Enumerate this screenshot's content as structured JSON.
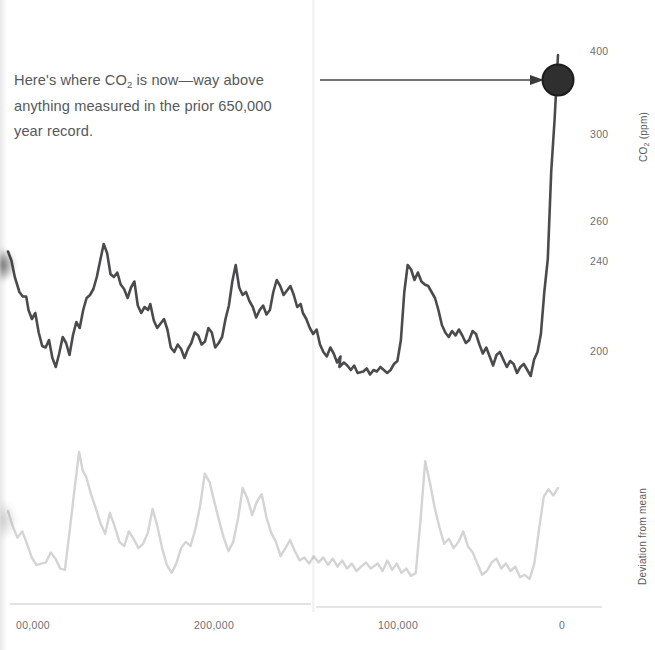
{
  "annotation": {
    "line1": "Here's where CO",
    "sub": "2",
    "line1b": " is now—way above",
    "line2": "anything measured in the prior 650,000",
    "line3": "year record."
  },
  "axes": {
    "y_title_top": "CO",
    "y_title_top_sub": "2",
    "y_title_top_unit": " (ppm)",
    "y_title_bottom": "Deviation from mean",
    "y_ticks": [
      {
        "label": "400",
        "y": 52
      },
      {
        "label": "300",
        "y": 135
      },
      {
        "label": "260",
        "y": 222
      },
      {
        "label": "240",
        "y": 262
      },
      {
        "label": "200",
        "y": 352
      }
    ],
    "x_ticks": [
      {
        "label": "00,000",
        "x": 32
      },
      {
        "label": "200,000",
        "x": 214
      },
      {
        "label": "100,000",
        "x": 398
      },
      {
        "label": "0",
        "x": 562
      }
    ]
  },
  "colors": {
    "co2_line": "#4b4b4d",
    "deviation_line": "#d4d4d4",
    "marker": "#2b2b2b",
    "arrow": "#3a3a3a",
    "axis": "#d8d8d8",
    "text": "#55595c"
  },
  "chart_data": {
    "type": "line",
    "title": "",
    "subtitle": "",
    "xlabel": "",
    "ylabel": "CO2 (ppm)",
    "ylabel_secondary": "Deviation from mean",
    "xlim": [
      650000,
      0
    ],
    "ylim": [
      150,
      415
    ],
    "grid": false,
    "legend": "none",
    "annotation_text": "Here's where CO2 is now—way above anything measured in the prior 650,000 year record.",
    "marker_point": {
      "x": 0,
      "y": 400,
      "label": "present-day CO2"
    },
    "series": [
      {
        "name": "CO2 (ppm)",
        "color": "#4b4b4d",
        "axis": "left",
        "points": [
          [
            0,
            267
          ],
          [
            3,
            261
          ],
          [
            6,
            250
          ],
          [
            10,
            240
          ],
          [
            13,
            237
          ],
          [
            16,
            237
          ],
          [
            18,
            228
          ],
          [
            21,
            222
          ],
          [
            24,
            226
          ],
          [
            27,
            213
          ],
          [
            30,
            204
          ],
          [
            33,
            203
          ],
          [
            36,
            208
          ],
          [
            39,
            196
          ],
          [
            42,
            190
          ],
          [
            45,
            199
          ],
          [
            48,
            210
          ],
          [
            51,
            206
          ],
          [
            54,
            198
          ],
          [
            57,
            211
          ],
          [
            60,
            220
          ],
          [
            63,
            216
          ],
          [
            66,
            228
          ],
          [
            69,
            236
          ],
          [
            72,
            238
          ],
          [
            75,
            242
          ],
          [
            78,
            250
          ],
          [
            81,
            261
          ],
          [
            84,
            272
          ],
          [
            87,
            266
          ],
          [
            90,
            252
          ],
          [
            93,
            250
          ],
          [
            96,
            253
          ],
          [
            99,
            245
          ],
          [
            102,
            242
          ],
          [
            105,
            236
          ],
          [
            108,
            243
          ],
          [
            111,
            247
          ],
          [
            114,
            231
          ],
          [
            117,
            226
          ],
          [
            120,
            230
          ],
          [
            123,
            228
          ],
          [
            125,
            232
          ],
          [
            128,
            221
          ],
          [
            131,
            216
          ],
          [
            134,
            219
          ],
          [
            137,
            222
          ],
          [
            140,
            215
          ],
          [
            143,
            203
          ],
          [
            146,
            200
          ],
          [
            149,
            205
          ],
          [
            152,
            202
          ],
          [
            155,
            196
          ],
          [
            158,
            202
          ],
          [
            161,
            206
          ],
          [
            164,
            213
          ],
          [
            167,
            211
          ],
          [
            170,
            205
          ],
          [
            173,
            207
          ],
          [
            176,
            216
          ],
          [
            179,
            213
          ],
          [
            182,
            203
          ],
          [
            185,
            206
          ],
          [
            188,
            210
          ],
          [
            191,
            222
          ],
          [
            194,
            231
          ],
          [
            197,
            247
          ],
          [
            200,
            258
          ],
          [
            203,
            243
          ],
          [
            206,
            238
          ],
          [
            209,
            240
          ],
          [
            212,
            234
          ],
          [
            215,
            230
          ],
          [
            218,
            223
          ],
          [
            221,
            228
          ],
          [
            224,
            231
          ],
          [
            227,
            225
          ],
          [
            230,
            228
          ],
          [
            233,
            240
          ],
          [
            236,
            248
          ],
          [
            239,
            244
          ],
          [
            242,
            238
          ],
          [
            245,
            241
          ],
          [
            248,
            244
          ],
          [
            251,
            238
          ],
          [
            254,
            230
          ],
          [
            257,
            232
          ],
          [
            259,
            226
          ],
          [
            262,
            222
          ],
          [
            265,
            216
          ],
          [
            268,
            212
          ],
          [
            271,
            215
          ],
          [
            274,
            205
          ],
          [
            277,
            200
          ],
          [
            280,
            197
          ],
          [
            283,
            203
          ],
          [
            286,
            199
          ],
          [
            289,
            193
          ],
          [
            292,
            197
          ],
          [
            291,
            190
          ],
          [
            295,
            193
          ],
          [
            298,
            191
          ],
          [
            301,
            188
          ],
          [
            304,
            191
          ],
          [
            307,
            186
          ],
          [
            312,
            187
          ],
          [
            315,
            189
          ],
          [
            318,
            185
          ],
          [
            321,
            188
          ],
          [
            324,
            187
          ],
          [
            327,
            190
          ],
          [
            330,
            188
          ],
          [
            333,
            186
          ],
          [
            336,
            188
          ],
          [
            339,
            192
          ],
          [
            342,
            194
          ],
          [
            345,
            208
          ],
          [
            348,
            240
          ],
          [
            351,
            258
          ],
          [
            354,
            255
          ],
          [
            357,
            248
          ],
          [
            360,
            253
          ],
          [
            363,
            247
          ],
          [
            366,
            245
          ],
          [
            369,
            244
          ],
          [
            372,
            240
          ],
          [
            375,
            236
          ],
          [
            378,
            228
          ],
          [
            381,
            218
          ],
          [
            384,
            213
          ],
          [
            387,
            210
          ],
          [
            390,
            214
          ],
          [
            393,
            211
          ],
          [
            396,
            215
          ],
          [
            399,
            211
          ],
          [
            402,
            206
          ],
          [
            405,
            208
          ],
          [
            408,
            214
          ],
          [
            411,
            212
          ],
          [
            414,
            205
          ],
          [
            417,
            199
          ],
          [
            420,
            203
          ],
          [
            423,
            197
          ],
          [
            426,
            191
          ],
          [
            429,
            198
          ],
          [
            432,
            200
          ],
          [
            435,
            195
          ],
          [
            438,
            190
          ],
          [
            441,
            194
          ],
          [
            444,
            192
          ],
          [
            447,
            186
          ],
          [
            450,
            190
          ],
          [
            453,
            192
          ],
          [
            456,
            188
          ],
          [
            459,
            184
          ],
          [
            462,
            195
          ],
          [
            465,
            200
          ],
          [
            468,
            212
          ],
          [
            471,
            240
          ],
          [
            474,
            262
          ],
          [
            477,
            320
          ],
          [
            480,
            355
          ],
          [
            483,
            398
          ]
        ]
      },
      {
        "name": "Deviation from mean",
        "color": "#d4d4d4",
        "axis": "right",
        "points": [
          [
            0,
            0.55
          ],
          [
            4,
            0.3
          ],
          [
            8,
            0.12
          ],
          [
            12,
            0.22
          ],
          [
            16,
            0.02
          ],
          [
            20,
            -0.2
          ],
          [
            24,
            -0.32
          ],
          [
            28,
            -0.3
          ],
          [
            32,
            -0.28
          ],
          [
            36,
            -0.12
          ],
          [
            40,
            -0.22
          ],
          [
            44,
            -0.38
          ],
          [
            48,
            -0.4
          ],
          [
            52,
            0.22
          ],
          [
            56,
            0.88
          ],
          [
            60,
            1.5
          ],
          [
            63,
            1.2
          ],
          [
            66,
            1.1
          ],
          [
            70,
            0.82
          ],
          [
            74,
            0.6
          ],
          [
            78,
            0.35
          ],
          [
            82,
            0.18
          ],
          [
            86,
            0.52
          ],
          [
            90,
            0.3
          ],
          [
            94,
            0.05
          ],
          [
            98,
            -0.02
          ],
          [
            102,
            0.22
          ],
          [
            106,
            0.1
          ],
          [
            110,
            -0.05
          ],
          [
            114,
            0.02
          ],
          [
            118,
            0.2
          ],
          [
            122,
            0.58
          ],
          [
            126,
            0.3
          ],
          [
            130,
            -0.05
          ],
          [
            134,
            -0.32
          ],
          [
            138,
            -0.45
          ],
          [
            142,
            -0.3
          ],
          [
            146,
            -0.05
          ],
          [
            150,
            0.05
          ],
          [
            154,
            -0.02
          ],
          [
            158,
            0.25
          ],
          [
            162,
            0.62
          ],
          [
            166,
            1.15
          ],
          [
            170,
            1.02
          ],
          [
            174,
            0.7
          ],
          [
            178,
            0.4
          ],
          [
            182,
            0.12
          ],
          [
            186,
            -0.1
          ],
          [
            190,
            0.05
          ],
          [
            194,
            0.42
          ],
          [
            198,
            0.92
          ],
          [
            202,
            0.75
          ],
          [
            206,
            0.48
          ],
          [
            210,
            0.7
          ],
          [
            214,
            0.82
          ],
          [
            218,
            0.45
          ],
          [
            222,
            0.2
          ],
          [
            226,
            0.05
          ],
          [
            230,
            -0.18
          ],
          [
            234,
            -0.05
          ],
          [
            238,
            0.08
          ],
          [
            242,
            -0.1
          ],
          [
            246,
            -0.25
          ],
          [
            250,
            -0.2
          ],
          [
            254,
            -0.3
          ],
          [
            258,
            -0.18
          ],
          [
            262,
            -0.28
          ],
          [
            266,
            -0.2
          ],
          [
            270,
            -0.32
          ],
          [
            274,
            -0.22
          ],
          [
            278,
            -0.35
          ],
          [
            282,
            -0.25
          ],
          [
            286,
            -0.38
          ],
          [
            290,
            -0.3
          ],
          [
            294,
            -0.42
          ],
          [
            298,
            -0.35
          ],
          [
            302,
            -0.28
          ],
          [
            306,
            -0.38
          ],
          [
            312,
            -0.3
          ],
          [
            316,
            -0.42
          ],
          [
            320,
            -0.25
          ],
          [
            324,
            -0.4
          ],
          [
            328,
            -0.3
          ],
          [
            332,
            -0.45
          ],
          [
            336,
            -0.38
          ],
          [
            340,
            -0.5
          ],
          [
            344,
            -0.45
          ],
          [
            348,
            0.4
          ],
          [
            352,
            1.35
          ],
          [
            356,
            1.0
          ],
          [
            360,
            0.6
          ],
          [
            364,
            0.28
          ],
          [
            368,
            0.02
          ],
          [
            372,
            0.1
          ],
          [
            376,
            -0.05
          ],
          [
            380,
            0.05
          ],
          [
            384,
            0.22
          ],
          [
            388,
            -0.02
          ],
          [
            392,
            -0.12
          ],
          [
            396,
            -0.3
          ],
          [
            400,
            -0.48
          ],
          [
            404,
            -0.42
          ],
          [
            408,
            -0.28
          ],
          [
            412,
            -0.22
          ],
          [
            416,
            -0.38
          ],
          [
            420,
            -0.3
          ],
          [
            424,
            -0.42
          ],
          [
            428,
            -0.35
          ],
          [
            432,
            -0.52
          ],
          [
            436,
            -0.48
          ],
          [
            440,
            -0.55
          ],
          [
            444,
            -0.3
          ],
          [
            448,
            0.25
          ],
          [
            452,
            0.78
          ],
          [
            456,
            0.9
          ],
          [
            460,
            0.8
          ],
          [
            464,
            0.92
          ]
        ]
      }
    ]
  }
}
